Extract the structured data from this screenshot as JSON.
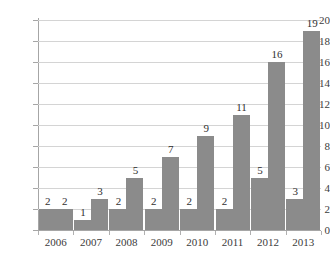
{
  "chart_data": {
    "type": "bar",
    "title": "",
    "subtitle": "",
    "xlabel": "",
    "ylabel": "",
    "categories": [
      "2006",
      "2007",
      "2008",
      "2009",
      "2010",
      "2011",
      "2012",
      "2013"
    ],
    "series": [
      {
        "name": "Series 1",
        "values": [
          2,
          1,
          2,
          2,
          2,
          2,
          5,
          3
        ]
      },
      {
        "name": "Series 2",
        "values": [
          2,
          3,
          5,
          7,
          9,
          11,
          16,
          19
        ]
      }
    ],
    "data_labels": [
      [
        "2",
        "2"
      ],
      [
        "1",
        "3"
      ],
      [
        "2",
        "5"
      ],
      [
        "2",
        "7"
      ],
      [
        "2",
        "9"
      ],
      [
        "2",
        "11"
      ],
      [
        "5",
        "16"
      ],
      [
        "3",
        "19"
      ]
    ],
    "ylim": [
      0,
      20
    ],
    "ytick_values": [
      0,
      2,
      4,
      6,
      8,
      10,
      12,
      14,
      16,
      18,
      20
    ],
    "ytick_labels": [
      "0",
      "2",
      "4",
      "6",
      "8",
      "10",
      "12",
      "14",
      "16",
      "18",
      "20"
    ],
    "grid": true,
    "grid_axis": "y",
    "legend": false,
    "legend_position": "none",
    "colors": {
      "bar": "#8b8b8b",
      "gridline": "#d4d4d4",
      "axis": "#a6a6a6",
      "text": "#3c3c3c",
      "background": "#ffffff"
    }
  }
}
